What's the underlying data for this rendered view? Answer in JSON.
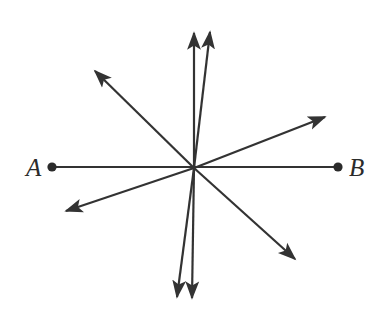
{
  "figure": {
    "type": "geometry-ray-diagram",
    "background_color": "#ffffff",
    "stroke_color": "#333333",
    "line_width": 2.2,
    "width": 380,
    "height": 319,
    "vertex": {
      "x": 194,
      "y": 168,
      "name": "common-endpoint"
    },
    "labels": [
      {
        "id": "A",
        "text": "A",
        "x": 26,
        "y": 155,
        "style": "italic-serif"
      },
      {
        "id": "B",
        "text": "B",
        "x": 349,
        "y": 155,
        "style": "italic-serif"
      }
    ],
    "endpoints": [
      {
        "id": "point-a",
        "x": 52,
        "y": 167,
        "radius": 4.6,
        "filled": true
      },
      {
        "id": "point-b",
        "x": 338,
        "y": 167,
        "radius": 4.6,
        "filled": true
      }
    ],
    "segment": {
      "name": "segment-ab",
      "from": {
        "x": 52,
        "y": 167
      },
      "to": {
        "x": 338,
        "y": 167
      },
      "arrowheads": "none"
    },
    "rays": [
      {
        "id": "ray-up-left",
        "name": "ray-up-near-vertical-left",
        "to_x": 194,
        "to_y": 33,
        "angle_deg": 90.0,
        "arrowhead": true
      },
      {
        "id": "ray-up-right",
        "name": "ray-up-tilted-right",
        "to_x": 210,
        "to_y": 32,
        "angle_deg": 83.3,
        "arrowhead": true
      },
      {
        "id": "ray-upper-left",
        "name": "ray-upper-left-diagonal",
        "to_x": 95,
        "to_y": 71,
        "angle_deg": 135.6,
        "arrowhead": true
      },
      {
        "id": "ray-upper-right",
        "name": "ray-upper-right-diagonal",
        "to_x": 325,
        "to_y": 117,
        "angle_deg": 21.0,
        "arrowhead": true
      },
      {
        "id": "ray-lower-left",
        "name": "ray-lower-left-diagonal",
        "to_x": 66,
        "to_y": 211,
        "angle_deg": 198.6,
        "arrowhead": true
      },
      {
        "id": "ray-lower-right",
        "name": "ray-lower-right-diagonal",
        "to_x": 295,
        "to_y": 259,
        "angle_deg": 312.0,
        "arrowhead": true
      },
      {
        "id": "ray-down-left",
        "name": "ray-down-tilted-left",
        "to_x": 177,
        "to_y": 297,
        "angle_deg": 262.4,
        "arrowhead": true
      },
      {
        "id": "ray-down-right",
        "name": "ray-down-near-vertical",
        "to_x": 192,
        "to_y": 298,
        "angle_deg": 270.9,
        "arrowhead": true
      }
    ]
  }
}
